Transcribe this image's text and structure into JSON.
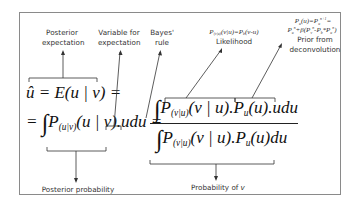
{
  "diagram": {
    "title_labels": {
      "posterior_expectation": [
        "Posterior",
        "expectation"
      ],
      "variable_for_expectation": [
        "Variable for",
        "expectation"
      ],
      "bayes_rule": [
        "Bayes'",
        "rule"
      ],
      "likelihood_formula": "P(v|u)(v|u)=Pb(v-u)",
      "likelihood": "Likelihood",
      "prior_formula_line1": "Pu(u)=Pun+1=",
      "prior_formula_line2": "Pun+β(Pvn-Pb*Pun)",
      "prior_from": "Prior from",
      "deconvolution": "deconvolution",
      "posterior_probability": "Posterior probability",
      "probability_of_v": "Probability of v"
    },
    "equations": {
      "line1": "û = E(u | v) =",
      "line2_lhs": "= ∫ P(u|v)(u | v).udu =",
      "numerator": "∫ P(v|u)(v | u).Pu(u).udu",
      "denominator": "∫ P(v|u)(v | u).Pu(u)du"
    },
    "colors": {
      "border": "#8a8a8a",
      "text": "#111111",
      "arrows": "#333333"
    }
  }
}
